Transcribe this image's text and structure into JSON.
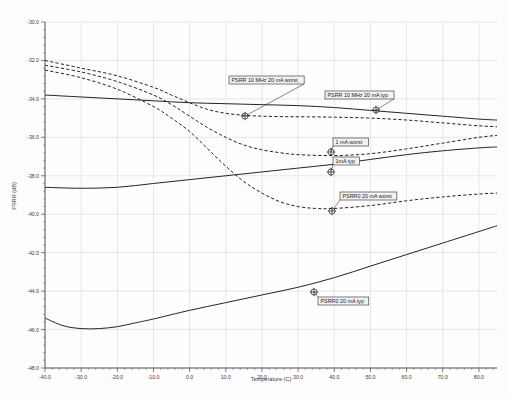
{
  "chart_data": {
    "type": "line",
    "title": "",
    "xlabel": "Temperature (C)",
    "ylabel": "PSRR (dB)",
    "xlim": [
      -40.0,
      85.0
    ],
    "ylim": [
      -48.0,
      -30.0
    ],
    "grid": true,
    "legend_position": "inline-annotations",
    "xticks": [
      -40.0,
      -30.0,
      -20.0,
      -10.0,
      0.0,
      10.0,
      20.0,
      30.0,
      40.0,
      50.0,
      60.0,
      70.0,
      80.0
    ],
    "xticklabels": [
      "-40.0",
      "-30.0",
      "-20.0",
      "-10.0",
      "0.0",
      "10.0",
      "20.0",
      "30.0",
      "40.0",
      "50.0",
      "60.0",
      "70.0",
      "80.0"
    ],
    "yticks": [
      -30.0,
      -32.0,
      -34.0,
      -36.0,
      -38.0,
      -40.0,
      -42.0,
      -44.0,
      -46.0,
      -48.0
    ],
    "yticklabels": [
      "-30.0",
      "-32.0",
      "-34.0",
      "-36.0",
      "-38.0",
      "-40.0",
      "-42.0",
      "-44.0",
      "-46.0",
      "-48.0"
    ],
    "series": [
      {
        "name": "PSRR 10 MHz 20 mA worst",
        "style": "dashed",
        "x": [
          -40,
          -30,
          -20,
          -10,
          -5,
          0,
          5,
          10,
          15,
          20,
          25,
          30,
          40,
          50,
          60,
          70,
          80,
          85
        ],
        "values": [
          -32.0,
          -32.4,
          -32.8,
          -33.4,
          -33.8,
          -34.2,
          -34.55,
          -34.75,
          -34.85,
          -34.9,
          -34.92,
          -34.93,
          -34.95,
          -35.0,
          -35.1,
          -35.25,
          -35.4,
          -35.45
        ]
      },
      {
        "name": "PSRR 10 MHz 20 mA typ",
        "style": "solid",
        "x": [
          -40,
          -30,
          -20,
          -10,
          0,
          10,
          20,
          30,
          40,
          50,
          60,
          70,
          80,
          85
        ],
        "values": [
          -33.8,
          -33.9,
          -34.0,
          -34.1,
          -34.2,
          -34.25,
          -34.3,
          -34.35,
          -34.45,
          -34.6,
          -34.75,
          -34.9,
          -35.05,
          -35.1
        ]
      },
      {
        "name": "1 mA worst",
        "style": "dashed",
        "x": [
          -40,
          -30,
          -20,
          -10,
          -5,
          0,
          5,
          10,
          15,
          20,
          25,
          30,
          40,
          50,
          60,
          70,
          80,
          85
        ],
        "values": [
          -32.25,
          -32.6,
          -33.1,
          -33.8,
          -34.3,
          -34.9,
          -35.5,
          -36.0,
          -36.4,
          -36.65,
          -36.8,
          -36.9,
          -36.95,
          -36.85,
          -36.6,
          -36.3,
          -36.0,
          -35.9
        ]
      },
      {
        "name": "1mA typ",
        "style": "solid",
        "x": [
          -40,
          -30,
          -20,
          -10,
          0,
          10,
          20,
          30,
          40,
          50,
          60,
          70,
          80,
          85
        ],
        "values": [
          -38.6,
          -38.65,
          -38.6,
          -38.4,
          -38.2,
          -38.0,
          -37.8,
          -37.6,
          -37.4,
          -37.15,
          -36.9,
          -36.7,
          -36.55,
          -36.5
        ]
      },
      {
        "name": "PSRR0 20 mA worst",
        "style": "dashed",
        "x": [
          -40,
          -30,
          -20,
          -10,
          -5,
          0,
          5,
          10,
          15,
          20,
          25,
          30,
          35,
          40,
          50,
          60,
          70,
          80,
          85
        ],
        "values": [
          -32.5,
          -32.9,
          -33.5,
          -34.4,
          -35.0,
          -35.7,
          -36.6,
          -37.5,
          -38.3,
          -38.9,
          -39.35,
          -39.6,
          -39.7,
          -39.7,
          -39.55,
          -39.3,
          -39.1,
          -38.95,
          -38.9
        ]
      },
      {
        "name": "PSRR0 20 mA typ",
        "style": "solid",
        "x": [
          -40,
          -35,
          -30,
          -25,
          -20,
          -15,
          -10,
          0,
          10,
          20,
          30,
          40,
          50,
          60,
          70,
          80,
          85
        ],
        "values": [
          -45.4,
          -45.8,
          -45.95,
          -45.95,
          -45.85,
          -45.65,
          -45.45,
          -45.0,
          -44.6,
          -44.2,
          -43.8,
          -43.3,
          -42.7,
          -42.1,
          -41.5,
          -40.9,
          -40.6
        ]
      }
    ],
    "annotations": [
      {
        "id": "ann-psrr10m-worst",
        "label": "PSRR 10 MHz 20 mA worst",
        "box_x": 229,
        "box_y": 76,
        "marker_x": 245,
        "marker_y": 116
      },
      {
        "id": "ann-psrr10m-typ",
        "label": "PSRR 10 MHz 20 mA typ",
        "box_x": 325,
        "box_y": 91,
        "marker_x": 376,
        "marker_y": 110
      },
      {
        "id": "ann-1ma-worst",
        "label": "1 mA worst",
        "box_x": 333,
        "box_y": 138,
        "marker_x": 331,
        "marker_y": 152
      },
      {
        "id": "ann-1ma-typ",
        "label": "1mA typ",
        "box_x": 333,
        "box_y": 157,
        "marker_x": 331,
        "marker_y": 172
      },
      {
        "id": "ann-psrr0-worst",
        "label": "PSRR0 20 mA worst",
        "box_x": 340,
        "box_y": 192,
        "marker_x": 332,
        "marker_y": 211
      },
      {
        "id": "ann-psrr0-typ",
        "label": "PSRR0 20 mA typ",
        "box_x": 318,
        "box_y": 297,
        "marker_x": 314,
        "marker_y": 292
      }
    ],
    "colors": {
      "curve": "#242424",
      "grid": "#d8d8d8",
      "axis": "#4a4a4a",
      "annotation_box_fill": "#f2f2f2",
      "background": "#fdfdfd"
    }
  }
}
